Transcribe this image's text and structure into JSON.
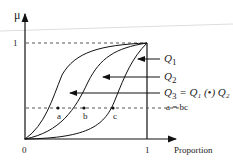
{
  "diagram": {
    "y_axis_label": "μ",
    "x_axis_label": "Proportion",
    "origin_label": "0",
    "x_one_label": "1",
    "y_one_label": "1",
    "curves": [
      {
        "name": "Q1",
        "label": "Q",
        "sub": "1"
      },
      {
        "name": "Q2",
        "label": "Q",
        "sub": "2"
      },
      {
        "name": "Q3",
        "label": "Q",
        "sub": "3",
        "equation": " = Q₁ (•) Q₂"
      }
    ],
    "points": [
      "a",
      "b",
      "c"
    ],
    "relation": "a = bc"
  }
}
